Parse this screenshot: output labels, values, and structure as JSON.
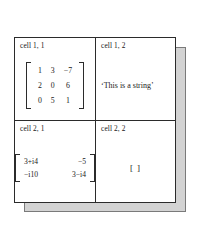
{
  "figure": {
    "type": "cell-array-diagram",
    "colors": {
      "border": "#2b2b2b",
      "shadow": "#d3d3d3",
      "shadow_border": "#7a7a7a",
      "background": "#ffffff",
      "text": "#1a1a1a"
    },
    "cells": [
      {
        "id": "cell-1-1",
        "label": "cell 1, 1",
        "content_type": "matrix",
        "matrix": {
          "rows": 3,
          "cols": 3,
          "values": [
            [
              "1",
              "3",
              "−7"
            ],
            [
              "2",
              "0",
              "6"
            ],
            [
              "0",
              "5",
              "1"
            ]
          ]
        }
      },
      {
        "id": "cell-1-2",
        "label": "cell 1, 2",
        "content_type": "string",
        "string_value": "‘This is a string’"
      },
      {
        "id": "cell-2-1",
        "label": "cell 2, 1",
        "content_type": "matrix",
        "matrix": {
          "rows": 2,
          "cols": 2,
          "values": [
            [
              "3+i4",
              "−5"
            ],
            [
              "−i10",
              "3−i4"
            ]
          ]
        }
      },
      {
        "id": "cell-2-2",
        "label": "cell 2, 2",
        "content_type": "empty-array",
        "empty_value": "[ ]"
      }
    ]
  }
}
